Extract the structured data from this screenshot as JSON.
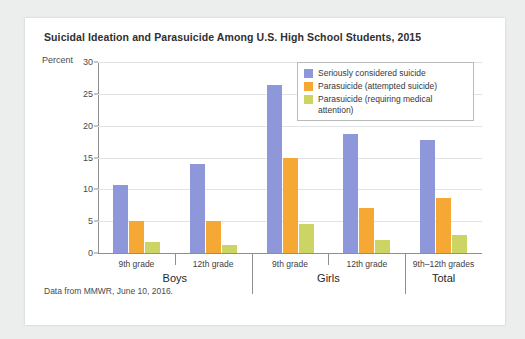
{
  "card": {
    "title": "Suicidal Ideation and Parasuicide Among U.S. High School Students, 2015",
    "source_note": "Data from MMWR, June 10, 2016.",
    "axis_unit_label": "Percent"
  },
  "legend": {
    "items": [
      {
        "label": "Seriously considered suicide",
        "color": "#8e97da",
        "swatch_name": "legend-swatch-blue"
      },
      {
        "label": "Parasuicide (attempted suicide)",
        "color": "#f5a833",
        "swatch_name": "legend-swatch-orange"
      },
      {
        "label": "Parasuicide (requiring medical attention)",
        "color": "#ccd463",
        "swatch_name": "legend-swatch-green"
      }
    ]
  },
  "chart_data": {
    "type": "bar",
    "title": "Suicidal Ideation and Parasuicide Among U.S. High School Students, 2015",
    "xlabel": "",
    "ylabel": "Percent",
    "ylim": [
      0,
      30
    ],
    "yticks": [
      0,
      5,
      10,
      15,
      20,
      25,
      30
    ],
    "ytick_labels": [
      "0",
      "5",
      "10",
      "15",
      "20",
      "25",
      "30"
    ],
    "grid": true,
    "legend_position": "upper right (inside plot)",
    "categories": [
      "9th grade",
      "12th grade",
      "9th grade",
      "12th grade",
      "9th–12th grades"
    ],
    "groups": [
      {
        "name": "Boys",
        "categories": [
          "9th grade",
          "12th grade"
        ]
      },
      {
        "name": "Girls",
        "categories": [
          "9th grade",
          "12th grade"
        ]
      },
      {
        "name": "Total",
        "categories": [
          "9th–12th grades"
        ]
      }
    ],
    "series": [
      {
        "name": "Seriously considered suicide",
        "color": "#8e97da",
        "values": [
          10.7,
          14.0,
          26.4,
          18.7,
          17.7
        ]
      },
      {
        "name": "Parasuicide (attempted suicide)",
        "color": "#f5a833",
        "values": [
          5.0,
          5.0,
          15.0,
          7.0,
          8.6
        ]
      },
      {
        "name": "Parasuicide (requiring medical attention)",
        "color": "#ccd463",
        "values": [
          1.8,
          1.2,
          4.6,
          2.1,
          2.8
        ]
      }
    ]
  }
}
